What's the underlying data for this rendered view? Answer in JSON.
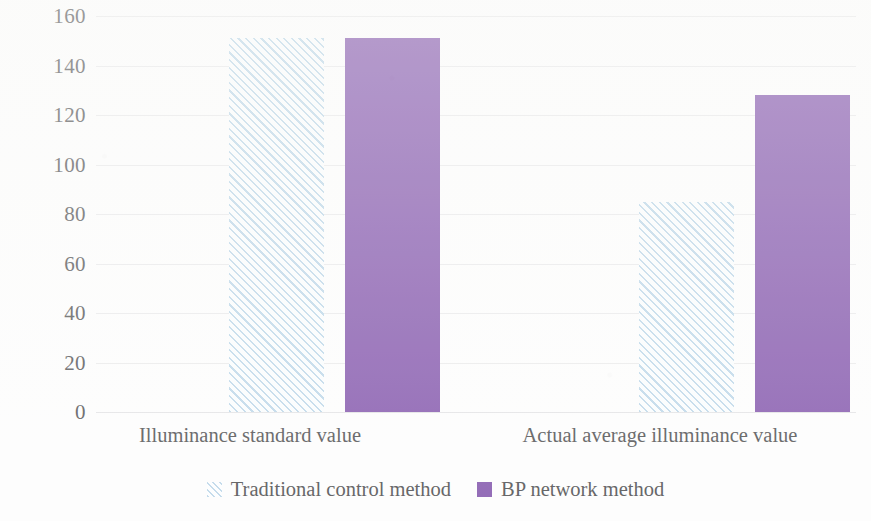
{
  "chart_data": {
    "type": "bar",
    "title": "",
    "xlabel": "",
    "ylabel": "",
    "categories": [
      "Illuminance standard value",
      "Actual average illuminance value"
    ],
    "series": [
      {
        "name": "Traditional control method",
        "values": [
          151,
          85
        ],
        "color": "#b9d5e8",
        "fill": "diagonal-hatch"
      },
      {
        "name": "BP network method",
        "values": [
          151,
          128
        ],
        "color": "#7d4da8",
        "fill": "solid"
      }
    ],
    "ylim": [
      0,
      160
    ],
    "ytick_step": 20,
    "yticks": [
      160,
      140,
      120,
      100,
      80,
      60,
      40,
      20,
      0
    ],
    "ytick_labels": [
      "160",
      "140",
      "120",
      "100",
      "80",
      "60",
      "40",
      "20",
      "0"
    ],
    "grid": true,
    "grid_axis": "y",
    "legend_position": "bottom-center",
    "annotations": []
  },
  "axis": {
    "y_tick_labels": [
      "160",
      "140",
      "120",
      "100",
      "80",
      "60",
      "40",
      "20",
      "0"
    ]
  },
  "categories": [
    {
      "label": "Illuminance standard value"
    },
    {
      "label": "Actual average illuminance value"
    }
  ],
  "legend": {
    "items": [
      {
        "label": "Traditional control method",
        "swatch": "hatched-swatch-icon"
      },
      {
        "label": "BP network method",
        "swatch": "solid-swatch-icon"
      }
    ]
  }
}
